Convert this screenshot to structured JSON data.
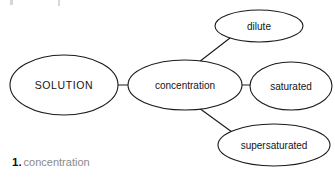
{
  "diagram": {
    "type": "concept-map",
    "title_node": "SOLUTION",
    "background_color": "#ffffff",
    "stroke_color": "#1a1a1a",
    "text_color": "#141414",
    "nodes": [
      {
        "id": "solution",
        "label": "SOLUTION",
        "role": "root",
        "cx": 64,
        "cy": 85,
        "rx": 54,
        "ry": 30
      },
      {
        "id": "concentration",
        "label": "concentration",
        "role": "branch",
        "cx": 185,
        "cy": 85,
        "rx": 57,
        "ry": 25
      },
      {
        "id": "dilute",
        "label": "dilute",
        "role": "leaf",
        "cx": 259,
        "cy": 26,
        "rx": 44,
        "ry": 16
      },
      {
        "id": "saturated",
        "label": "saturated",
        "role": "leaf",
        "cx": 291,
        "cy": 86,
        "rx": 41,
        "ry": 24
      },
      {
        "id": "supersaturated",
        "label": "supersaturated",
        "role": "leaf",
        "cx": 274,
        "cy": 145,
        "rx": 56,
        "ry": 21
      }
    ],
    "edges": [
      {
        "id": "edge-solution-concentration",
        "from": "solution",
        "to": "concentration",
        "style": "horizontal"
      },
      {
        "id": "edge-concentration-dilute",
        "from": "concentration",
        "to": "dilute",
        "style": "diagonal-up"
      },
      {
        "id": "edge-concentration-saturated",
        "from": "concentration",
        "to": "saturated",
        "style": "horizontal"
      },
      {
        "id": "edge-concentration-supersaturated",
        "from": "concentration",
        "to": "supersaturated",
        "style": "diagonal-down"
      }
    ]
  },
  "caption": {
    "number": "1.",
    "text": "concentration",
    "number_color": "#111111",
    "text_color": "#8a8a8a"
  }
}
